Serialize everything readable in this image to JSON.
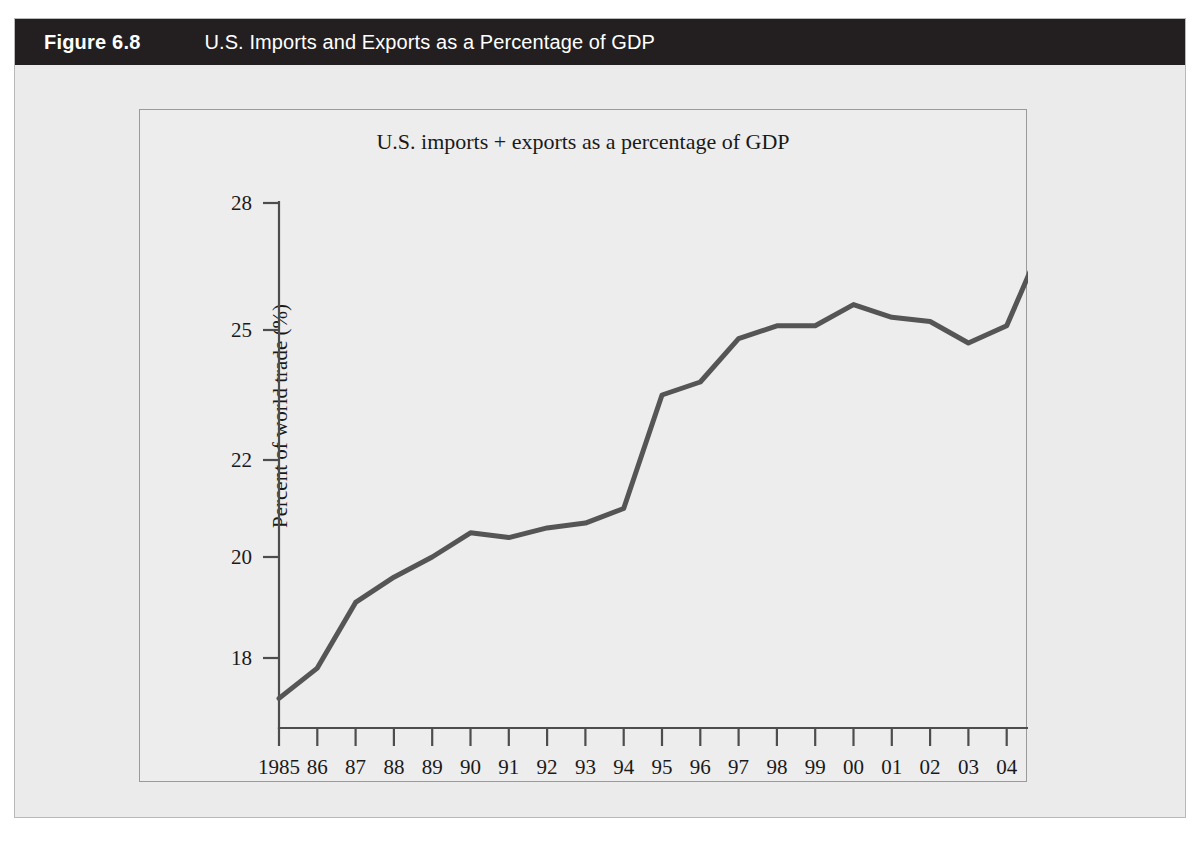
{
  "figure": {
    "number_label": "Figure 6.8",
    "caption": "U.S. Imports and Exports as a Percentage of GDP",
    "header_bg": "#231f20",
    "page_bg": "#ebebeb"
  },
  "chart_data": {
    "type": "line",
    "title": "U.S. imports + exports as a percentage of GDP",
    "xlabel": "",
    "ylabel": "Percent of world trade (%)",
    "x_tick_labels": [
      "1985",
      "86",
      "87",
      "88",
      "89",
      "90",
      "91",
      "92",
      "93",
      "94",
      "95",
      "96",
      "97",
      "98",
      "99",
      "00",
      "01",
      "02",
      "03",
      "04",
      "05"
    ],
    "categories": [
      1985,
      1986,
      1987,
      1988,
      1989,
      1990,
      1991,
      1992,
      1993,
      1994,
      1995,
      1996,
      1997,
      1998,
      1999,
      2000,
      2001,
      2002,
      2003,
      2004,
      2005
    ],
    "values": [
      17.2,
      17.8,
      19.1,
      19.6,
      20.0,
      20.5,
      20.4,
      20.6,
      20.7,
      21.0,
      23.5,
      23.8,
      24.8,
      25.1,
      25.1,
      25.6,
      25.3,
      25.2,
      24.7,
      25.1,
      27.2
    ],
    "y_tick_labels": [
      "28",
      "25",
      "22",
      "20",
      "18"
    ],
    "y_ticks": [
      28,
      25,
      22,
      20,
      18
    ],
    "ylim": [
      16.8,
      28.3
    ],
    "grid": false,
    "legend": "none",
    "line_color": "#555555",
    "axis_color": "#4d4d4d"
  }
}
